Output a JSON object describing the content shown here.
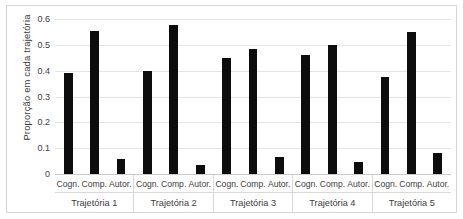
{
  "chart_data": {
    "type": "bar",
    "title": "",
    "subtitle": "",
    "xlabel": "",
    "ylabel": "Proporção em cada trajetória",
    "ylim": [
      0,
      0.6
    ],
    "ytick_labels": [
      "0.6",
      "0.5",
      "0.4",
      "0.3",
      "0.2",
      "0.1",
      "0"
    ],
    "ytick_values": [
      0.6,
      0.5,
      0.4,
      0.3,
      0.2,
      0.1,
      0
    ],
    "grid": true,
    "legend": "none",
    "group_label_name": "Trajetória",
    "subcategories": [
      "Cogn.",
      "Comp.",
      "Autor."
    ],
    "groups": [
      {
        "name": "Trajetória 1",
        "categories": [
          "Cogn.",
          "Comp.",
          "Autor."
        ],
        "values": [
          0.39,
          0.555,
          0.06
        ]
      },
      {
        "name": "Trajetória 2",
        "categories": [
          "Cogn.",
          "Comp.",
          "Autor."
        ],
        "values": [
          0.4,
          0.575,
          0.035
        ]
      },
      {
        "name": "Trajetória 3",
        "categories": [
          "Cogn.",
          "Comp.",
          "Autor."
        ],
        "values": [
          0.45,
          0.485,
          0.065
        ]
      },
      {
        "name": "Trajetória 4",
        "categories": [
          "Cogn.",
          "Comp.",
          "Autor."
        ],
        "values": [
          0.46,
          0.5,
          0.045
        ]
      },
      {
        "name": "Trajetória 5",
        "categories": [
          "Cogn.",
          "Comp.",
          "Autor."
        ],
        "values": [
          0.375,
          0.55,
          0.08
        ]
      }
    ],
    "categories": [
      "Cogn.",
      "Comp.",
      "Autor.",
      "Cogn.",
      "Comp.",
      "Autor.",
      "Cogn.",
      "Comp.",
      "Autor.",
      "Cogn.",
      "Comp.",
      "Autor.",
      "Cogn.",
      "Comp.",
      "Autor."
    ],
    "values": [
      0.39,
      0.555,
      0.06,
      0.4,
      0.575,
      0.035,
      0.45,
      0.485,
      0.065,
      0.46,
      0.5,
      0.045,
      0.375,
      0.55,
      0.08
    ],
    "colors": {
      "bar": "#0d0d0d",
      "grid": "#e4e4e4",
      "axis": "#c9c9c9",
      "text": "#3d3d3d",
      "background": "#ffffff",
      "border": "#d6d6d6"
    }
  }
}
